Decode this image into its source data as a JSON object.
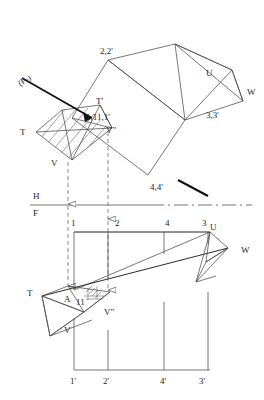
{
  "figure": {
    "background_color": "#ffffff",
    "line_color": "#4a4a4a",
    "heavy_line_color": "#111111",
    "text_color": "#262626"
  },
  "ground_line": {
    "upper_label": "H",
    "lower_label": "F"
  },
  "top_view": {
    "plane_trace_label": "(P-)",
    "vertex_labels": [
      {
        "key": "v22",
        "text": "2,2'"
      },
      {
        "key": "v33",
        "text": "3,3'"
      },
      {
        "key": "v44",
        "text": "4,4'"
      },
      {
        "key": "v111",
        "text": "1,11,1'"
      },
      {
        "key": "tprime",
        "text": "T'"
      },
      {
        "key": "vprime",
        "text": "V\""
      },
      {
        "key": "t",
        "text": "T"
      },
      {
        "key": "v",
        "text": "V"
      },
      {
        "key": "u",
        "text": "U"
      },
      {
        "key": "w",
        "text": "W"
      }
    ]
  },
  "front_view": {
    "top_station_labels": [
      "1",
      "2",
      "4",
      "3"
    ],
    "bottom_station_labels": [
      "1'",
      "2'",
      "4'",
      "3'"
    ],
    "vertex_labels": [
      {
        "key": "t",
        "text": "T"
      },
      {
        "key": "a",
        "text": "A"
      },
      {
        "key": "eleven",
        "text": "11"
      },
      {
        "key": "vprime",
        "text": "V\""
      },
      {
        "key": "v",
        "text": "V"
      },
      {
        "key": "u",
        "text": "U"
      },
      {
        "key": "w",
        "text": "W"
      }
    ]
  }
}
